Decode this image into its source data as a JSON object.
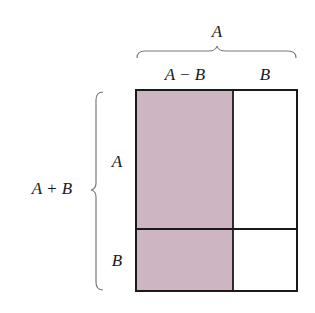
{
  "diagram": {
    "type": "area-decomposition",
    "colors": {
      "shaded_fill": "#cdb6c1",
      "unshaded_fill": "#ffffff",
      "outline": "#1a1a1a",
      "brace": "#7a7a7a"
    },
    "labels": {
      "top_total": "A",
      "top_left": "A − B",
      "top_right": "B",
      "left_total": "A + B",
      "left_upper": "A",
      "left_lower": "B"
    },
    "regions": [
      {
        "name": "top-left",
        "width": "A − B",
        "height": "A",
        "shaded": true
      },
      {
        "name": "top-right",
        "width": "B",
        "height": "A",
        "shaded": false
      },
      {
        "name": "bottom-left",
        "width": "A − B",
        "height": "B",
        "shaded": true
      },
      {
        "name": "bottom-right",
        "width": "B",
        "height": "B",
        "shaded": false
      }
    ]
  }
}
